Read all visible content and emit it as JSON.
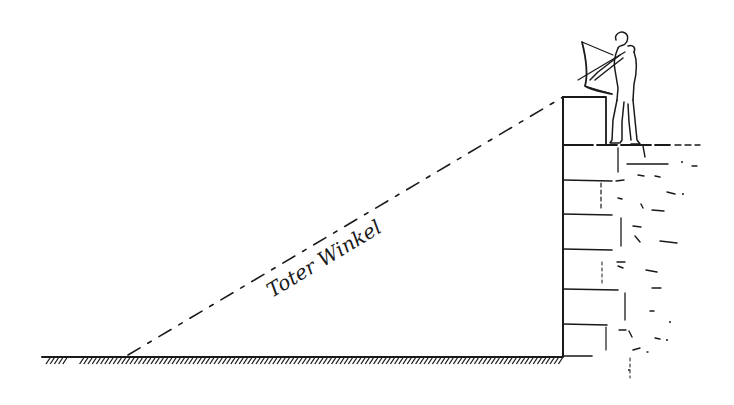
{
  "figure": {
    "type": "line-drawing",
    "label": "Toter Winkel",
    "colors": {
      "ink": "#1a1a1a",
      "background": "#ffffff"
    }
  },
  "scene": {
    "ground": {
      "y": 357,
      "x_start": 42,
      "x_end": 562
    },
    "tower": {
      "left_x": 563,
      "top_y": 145,
      "bottom_y": 357,
      "right_x": 700
    },
    "parapet": {
      "x": 563,
      "y": 97,
      "width": 43,
      "height": 48
    },
    "sightline": {
      "from": [
        128,
        355
      ],
      "to": [
        563,
        97
      ]
    },
    "archer": {
      "x": 620,
      "y": 40
    }
  }
}
